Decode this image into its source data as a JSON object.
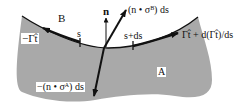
{
  "diagram": {
    "colors": {
      "region_fill": "#a9a9a9",
      "curve": "#111111",
      "background": "#ffffff"
    },
    "regions": {
      "upper": "B",
      "lower": "A"
    },
    "vectors": {
      "normal": "n",
      "traction_b": "(n • σᴮ) ds",
      "traction_a": "−(n • σᴬ) ds",
      "tension_left": "−Γt̂",
      "tension_right": "Γt̂ + d(Γt̂)/ds"
    },
    "points": {
      "s": "s",
      "s_plus_ds": "s+ds"
    }
  }
}
